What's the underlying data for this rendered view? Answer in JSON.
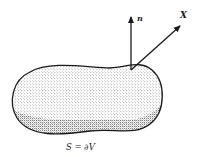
{
  "figure": {
    "region_label": "S = ∂V",
    "normal_label": "n",
    "vector_label": "X",
    "colors": {
      "ink": "#1a1a1a",
      "stipple": "#555555",
      "background": "#ffffff"
    }
  }
}
